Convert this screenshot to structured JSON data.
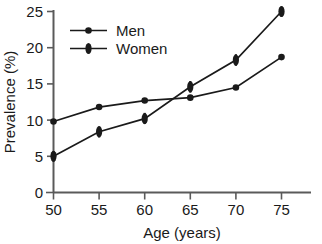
{
  "chart_data": {
    "type": "line",
    "title": "",
    "xlabel": "Age (years)",
    "ylabel": "Prevalence (%)",
    "xlim": [
      50,
      77
    ],
    "ylim": [
      0,
      25
    ],
    "x": [
      50,
      55,
      60,
      65,
      70,
      75
    ],
    "xticks": [
      "50",
      "55",
      "60",
      "65",
      "70",
      "75"
    ],
    "yticks": [
      "0",
      "5",
      "10",
      "15",
      "20",
      "25"
    ],
    "grid": false,
    "legend_position": "top-left",
    "series": [
      {
        "name": "Men",
        "marker": "circle",
        "color": "#1a1a1a",
        "has_error_bars": false,
        "values": [
          9.8,
          11.8,
          12.7,
          13.1,
          14.5,
          18.7
        ]
      },
      {
        "name": "Women",
        "marker": "vertical-ellipse",
        "color": "#1a1a1a",
        "has_error_bars": true,
        "values": [
          5.0,
          8.4,
          10.2,
          14.6,
          18.3,
          25.0
        ],
        "error_low": [
          4.3,
          7.6,
          9.5,
          13.8,
          17.5,
          24.3
        ],
        "error_high": [
          5.7,
          9.1,
          11.0,
          15.4,
          19.1,
          25.7
        ]
      }
    ]
  },
  "axes": {
    "x_title": "Age (years)",
    "y_title": "Prevalence (%)"
  },
  "legend": {
    "items": [
      {
        "label": "Men"
      },
      {
        "label": "Women"
      }
    ]
  }
}
